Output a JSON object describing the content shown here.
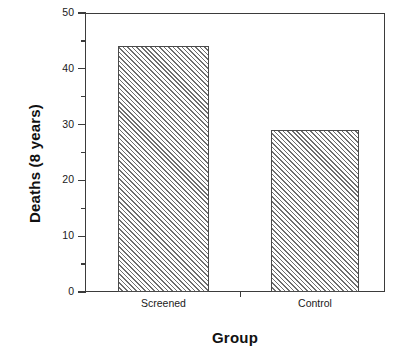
{
  "chart_data": {
    "type": "bar",
    "title": "",
    "subtitle": "",
    "xlabel": "Group",
    "ylabel": "Deaths (8 years)",
    "categories": [
      "Screened",
      "Control"
    ],
    "values": [
      44,
      29
    ],
    "ylim": [
      0,
      50
    ],
    "y_major_ticks": [
      0,
      10,
      20,
      30,
      40,
      50
    ],
    "y_minor_ticks": [
      5,
      15,
      25,
      35,
      45
    ],
    "y_tick_labels": [
      "0",
      "10",
      "20",
      "30",
      "40",
      "50"
    ],
    "grid": false,
    "legend": null,
    "legend_position": "none",
    "bar_fill": "hatched-diagonal",
    "colors": {
      "axis": "#3b3b3b",
      "bar_edge": "#4a4a4a",
      "bar_hatch": "#6e6e6e",
      "bar_face": "#ffffff",
      "text": "#1a1a1a",
      "background": "#ffffff"
    }
  },
  "axes": {
    "y_title": "Deaths (8 years)",
    "x_title": "Group"
  }
}
